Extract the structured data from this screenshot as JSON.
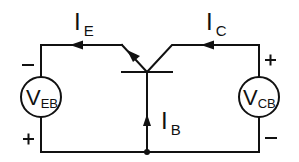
{
  "diagram": {
    "labels": {
      "emitter_current": {
        "main": "I",
        "sub": "E"
      },
      "collector_current": {
        "main": "I",
        "sub": "C"
      },
      "base_current": {
        "main": "I",
        "sub": "B"
      },
      "veb_source": {
        "main": "V",
        "sub": "EB"
      },
      "vcb_source": {
        "main": "V",
        "sub": "CB"
      }
    },
    "polarity": {
      "veb_top": "−",
      "veb_bottom": "+",
      "vcb_top": "+",
      "vcb_bottom": "−"
    },
    "colors": {
      "line": "#111111",
      "background": "#ffffff"
    }
  }
}
